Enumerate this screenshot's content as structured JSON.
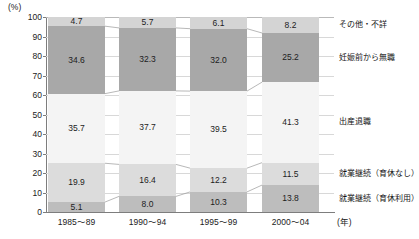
{
  "chart_data": {
    "type": "bar",
    "subtype": "stacked-100-percent",
    "title": "",
    "subtitle": "",
    "xlabel": "(年)",
    "ylabel": "(%)",
    "ylim": [
      0,
      100
    ],
    "yticks": [
      0,
      10,
      20,
      30,
      40,
      50,
      60,
      70,
      80,
      90,
      100
    ],
    "grid": true,
    "legend_position": "right",
    "categories": [
      "1985～89",
      "1990～94",
      "1995～99",
      "2000～04"
    ],
    "series": [
      {
        "name": "就業継続（育休利用）",
        "color": "#bdbdbd",
        "values": [
          5.1,
          8.0,
          10.3,
          13.8
        ],
        "labels": [
          "5.1",
          "8.0",
          "10.3",
          "13.8"
        ]
      },
      {
        "name": "就業継続（育休なし）",
        "color": "#dcdcdc",
        "values": [
          19.9,
          16.4,
          12.2,
          11.5
        ],
        "labels": [
          "19.9",
          "16.4",
          "12.2",
          "11.5"
        ]
      },
      {
        "name": "出産退職",
        "color": "#f4f4f4",
        "values": [
          35.7,
          37.7,
          39.5,
          41.3
        ],
        "labels": [
          "35.7",
          "37.7",
          "39.5",
          "41.3"
        ]
      },
      {
        "name": "妊娠前から無職",
        "color": "#a8a8a8",
        "values": [
          34.6,
          32.3,
          32.0,
          25.2
        ],
        "labels": [
          "34.6",
          "32.3",
          "32.0",
          "25.2"
        ]
      },
      {
        "name": "その他・不詳",
        "color": "#d4d4d4",
        "values": [
          4.7,
          5.7,
          6.1,
          8.2
        ],
        "labels": [
          "4.7",
          "5.7",
          "6.1",
          "8.2"
        ]
      }
    ]
  },
  "axis": {
    "unit_label": "(%)",
    "x_unit_label": "(年)",
    "ytick_labels": [
      "100",
      "90",
      "80",
      "70",
      "60",
      "50",
      "40",
      "30",
      "20",
      "10",
      "0"
    ],
    "xtick_labels": [
      "1985～89",
      "1990～94",
      "1995～99",
      "2000～04"
    ]
  },
  "legend": {
    "items": [
      {
        "label": "その他・不詳"
      },
      {
        "label": "妊娠前から無職"
      },
      {
        "label": "出産退職"
      },
      {
        "label": "就業継続（育休なし）"
      },
      {
        "label": "就業継続（育休利用）"
      }
    ]
  },
  "colors": {
    "other_unknown": "#d4d4d4",
    "jobless_before_pregnancy": "#a8a8a8",
    "retired_on_birth": "#f4f4f4",
    "continued_no_leave": "#dcdcdc",
    "continued_with_leave": "#bdbdbd",
    "gridline": "#d8d8d8",
    "axis": "#7d7d7d",
    "connector": "#9a9a9a"
  }
}
